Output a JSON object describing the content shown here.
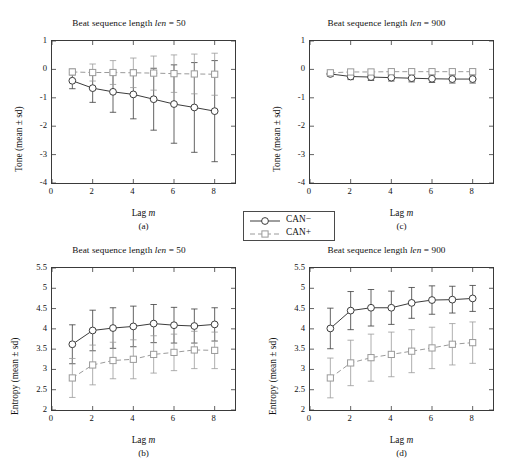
{
  "figure": {
    "background": "#ffffff",
    "series_colors": {
      "can_minus": "#3c3c3c",
      "can_plus": "#9a9a9a"
    }
  },
  "legend": {
    "entries": [
      {
        "label": "CAN−",
        "style": "solid",
        "marker": "circle",
        "color": "#3c3c3c"
      },
      {
        "label": "CAN+",
        "style": "dashed",
        "marker": "square",
        "color": "#9a9a9a"
      }
    ]
  },
  "panels": [
    {
      "id": "a",
      "caption": "(a)"
    },
    {
      "id": "b",
      "caption": "(b)"
    },
    {
      "id": "c",
      "caption": "(c)"
    },
    {
      "id": "d",
      "caption": "(d)"
    }
  ],
  "chart_data": [
    {
      "panel": "a",
      "caption": "(a)",
      "type": "line",
      "title_prefix": "Beat sequence length ",
      "title_italic": "len",
      "title_suffix": " = 50",
      "title": "Beat sequence length len = 50",
      "xlabel_prefix": "Lag ",
      "xlabel_italic": "m",
      "xlabel": "Lag m",
      "ylabel": "Tone (mean ± sd)",
      "x": [
        1,
        2,
        3,
        4,
        5,
        6,
        7,
        8
      ],
      "xlim": [
        0,
        9
      ],
      "ylim": [
        -4,
        1
      ],
      "xticks": [
        0,
        2,
        4,
        6,
        8
      ],
      "xticklabels": [
        "0",
        "2",
        "4",
        "6",
        "8"
      ],
      "yticks": [
        1,
        0,
        -1,
        -2,
        -3,
        -4
      ],
      "yticklabels": [
        "1",
        "0",
        "-1",
        "-2",
        "-3",
        "-4"
      ],
      "grid": false,
      "series": [
        {
          "name": "CAN−",
          "marker": "circle",
          "style": "solid",
          "values": [
            -0.4,
            -0.66,
            -0.79,
            -0.88,
            -1.05,
            -1.22,
            -1.34,
            -1.47
          ],
          "sd": [
            0.28,
            0.5,
            0.72,
            0.86,
            1.09,
            1.38,
            1.58,
            1.78
          ]
        },
        {
          "name": "CAN+",
          "marker": "square",
          "style": "dashed",
          "values": [
            -0.09,
            -0.11,
            -0.11,
            -0.12,
            -0.13,
            -0.15,
            -0.16,
            -0.17
          ],
          "sd": [
            0.11,
            0.3,
            0.42,
            0.52,
            0.6,
            0.66,
            0.7,
            0.74
          ]
        }
      ]
    },
    {
      "panel": "c",
      "caption": "(c)",
      "type": "line",
      "title_prefix": "Beat sequence length ",
      "title_italic": "len",
      "title_suffix": " = 900",
      "title": "Beat sequence length len = 900",
      "xlabel_prefix": "Lag ",
      "xlabel_italic": "m",
      "xlabel": "Lag m",
      "ylabel": "Tone (mean ± sd)",
      "x": [
        1,
        2,
        3,
        4,
        5,
        6,
        7,
        8
      ],
      "xlim": [
        0,
        9
      ],
      "ylim": [
        -4,
        1
      ],
      "xticks": [
        0,
        2,
        4,
        6,
        8
      ],
      "xticklabels": [
        "0",
        "2",
        "4",
        "6",
        "8"
      ],
      "yticks": [
        1,
        0,
        -1,
        -2,
        -3,
        -4
      ],
      "yticklabels": [
        "1",
        "0",
        "-1",
        "-2",
        "-3",
        "-4"
      ],
      "grid": false,
      "series": [
        {
          "name": "CAN−",
          "marker": "circle",
          "style": "solid",
          "values": [
            -0.16,
            -0.25,
            -0.27,
            -0.29,
            -0.31,
            -0.33,
            -0.34,
            -0.34
          ],
          "sd": [
            0.09,
            0.11,
            0.12,
            0.12,
            0.13,
            0.13,
            0.14,
            0.14
          ]
        },
        {
          "name": "CAN+",
          "marker": "square",
          "style": "dashed",
          "values": [
            -0.12,
            -0.09,
            -0.09,
            -0.08,
            -0.08,
            -0.08,
            -0.08,
            -0.08
          ],
          "sd": [
            0.09,
            0.08,
            0.08,
            0.08,
            0.08,
            0.08,
            0.08,
            0.08
          ]
        }
      ]
    },
    {
      "panel": "b",
      "caption": "(b)",
      "type": "line",
      "title_prefix": "Beat sequence length ",
      "title_italic": "len",
      "title_suffix": " = 50",
      "title": "Beat sequence length len = 50",
      "xlabel_prefix": "Lag ",
      "xlabel_italic": "m",
      "xlabel": "Lag m",
      "ylabel": "Entropy (mean ± sd)",
      "x": [
        1,
        2,
        3,
        4,
        5,
        6,
        7,
        8
      ],
      "xlim": [
        0,
        9
      ],
      "ylim": [
        2,
        5.5
      ],
      "xticks": [
        0,
        2,
        4,
        6,
        8
      ],
      "xticklabels": [
        "0",
        "2",
        "4",
        "6",
        "8"
      ],
      "yticks": [
        5.5,
        5,
        4.5,
        4,
        3.5,
        3,
        2.5,
        2
      ],
      "yticklabels": [
        "5.5",
        "5",
        "4.5",
        "4",
        "3.5",
        "3",
        "2.5",
        "2"
      ],
      "grid": false,
      "series": [
        {
          "name": "CAN−",
          "marker": "circle",
          "style": "solid",
          "values": [
            3.62,
            3.96,
            4.02,
            4.06,
            4.13,
            4.09,
            4.07,
            4.11
          ],
          "sd": [
            0.48,
            0.5,
            0.5,
            0.5,
            0.47,
            0.44,
            0.42,
            0.41
          ]
        },
        {
          "name": "CAN+",
          "marker": "square",
          "style": "dashed",
          "values": [
            2.79,
            3.11,
            3.22,
            3.25,
            3.37,
            3.42,
            3.48,
            3.47
          ],
          "sd": [
            0.48,
            0.49,
            0.45,
            0.48,
            0.46,
            0.45,
            0.46,
            0.45
          ]
        }
      ]
    },
    {
      "panel": "d",
      "caption": "(d)",
      "type": "line",
      "title_prefix": "Beat sequence length ",
      "title_italic": "len",
      "title_suffix": " = 900",
      "title": "Beat sequence length len = 900",
      "xlabel_prefix": "Lag ",
      "xlabel_italic": "m",
      "xlabel": "Lag m",
      "ylabel": "Entropy (mean ± sd)",
      "x": [
        1,
        2,
        3,
        4,
        5,
        6,
        7,
        8
      ],
      "xlim": [
        0,
        9
      ],
      "ylim": [
        2,
        5.5
      ],
      "xticks": [
        0,
        2,
        4,
        6,
        8
      ],
      "xticklabels": [
        "0",
        "2",
        "4",
        "6",
        "8"
      ],
      "yticks": [
        5.5,
        5,
        4.5,
        4,
        3.5,
        3,
        2.5,
        2
      ],
      "yticklabels": [
        "5.5",
        "5",
        "4.5",
        "4",
        "3.5",
        "3",
        "2.5",
        "2"
      ],
      "grid": false,
      "series": [
        {
          "name": "CAN−",
          "marker": "circle",
          "style": "solid",
          "values": [
            4.01,
            4.45,
            4.52,
            4.52,
            4.64,
            4.71,
            4.72,
            4.75
          ],
          "sd": [
            0.5,
            0.47,
            0.45,
            0.41,
            0.38,
            0.35,
            0.33,
            0.32
          ]
        },
        {
          "name": "CAN+",
          "marker": "square",
          "style": "dashed",
          "values": [
            2.79,
            3.16,
            3.29,
            3.37,
            3.45,
            3.53,
            3.62,
            3.66
          ],
          "sd": [
            0.49,
            0.56,
            0.58,
            0.55,
            0.53,
            0.51,
            0.51,
            0.51
          ]
        }
      ]
    }
  ]
}
